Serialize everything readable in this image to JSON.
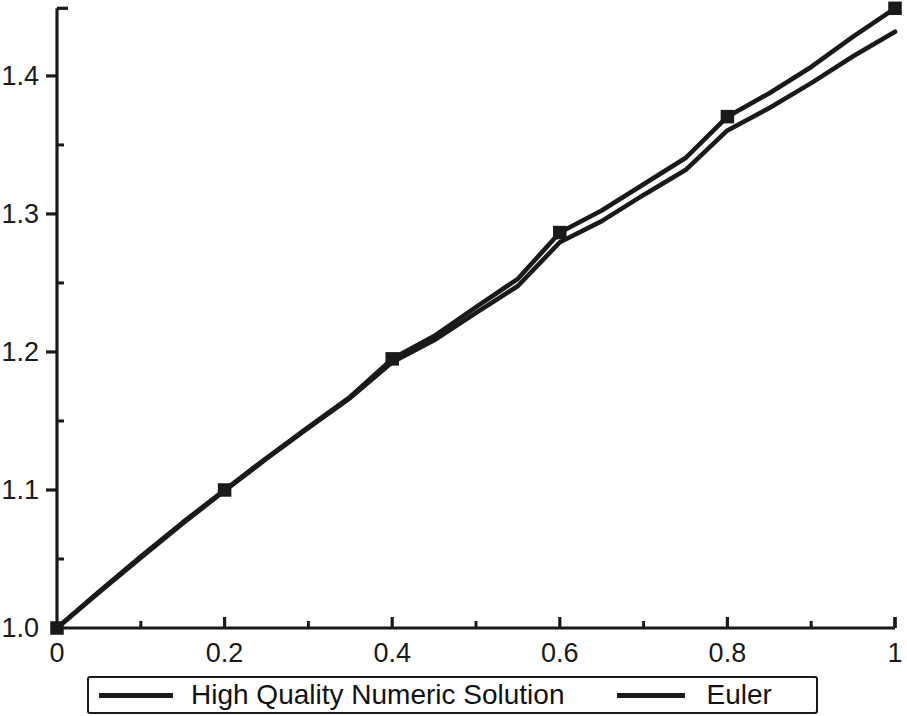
{
  "chart_data": {
    "type": "line",
    "title": "",
    "xlabel": "",
    "ylabel": "",
    "xlim": [
      0,
      1
    ],
    "ylim": [
      1.0,
      1.449
    ],
    "grid": false,
    "legend_position": "bottom",
    "x_ticks_major": [
      0,
      0.2,
      0.4,
      0.6,
      0.8,
      1
    ],
    "x_tick_labels": [
      "0",
      "0.2",
      "0.4",
      "0.6",
      "0.8",
      "1"
    ],
    "x_ticks_minor": [
      0.1,
      0.3,
      0.5,
      0.7,
      0.9
    ],
    "y_ticks_major": [
      1.0,
      1.1,
      1.2,
      1.3,
      1.4
    ],
    "y_tick_labels": [
      "1.0",
      "1.1",
      "1.2",
      "1.3",
      "1.4"
    ],
    "y_ticks_minor": [
      1.05,
      1.15,
      1.25,
      1.35,
      1.45
    ],
    "series": [
      {
        "name": "High Quality Numeric Solution",
        "color": "#1a1a1a",
        "marker": "square",
        "marker_x": [
          0,
          0.2,
          0.4,
          0.6,
          0.8,
          1.0
        ],
        "marker_y": [
          1.0,
          1.1,
          1.195,
          1.2865,
          1.3705,
          1.449
        ],
        "x": [
          0,
          0.05,
          0.1,
          0.15,
          0.2,
          0.25,
          0.3,
          0.35,
          0.4,
          0.45,
          0.5,
          0.55,
          0.6,
          0.65,
          0.7,
          0.75,
          0.8,
          0.85,
          0.9,
          0.95,
          1.0
        ],
        "y": [
          1.0,
          1.0262,
          1.0518,
          1.0765,
          1.1,
          1.1232,
          1.1456,
          1.1675,
          1.195,
          1.2115,
          1.2325,
          1.253,
          1.2865,
          1.3025,
          1.3215,
          1.3405,
          1.3705,
          1.3875,
          1.4065,
          1.4285,
          1.449
        ]
      },
      {
        "name": "Euler",
        "color": "#1a1a1a",
        "marker": "none",
        "x": [
          0,
          0.05,
          0.1,
          0.15,
          0.2,
          0.25,
          0.3,
          0.35,
          0.4,
          0.45,
          0.5,
          0.55,
          0.6,
          0.65,
          0.7,
          0.75,
          0.8,
          0.85,
          0.9,
          0.95,
          1.0
        ],
        "y": [
          1.0,
          1.0258,
          1.051,
          1.0757,
          1.0995,
          1.1226,
          1.1449,
          1.1668,
          1.1925,
          1.2085,
          1.2283,
          1.2478,
          1.2795,
          1.2948,
          1.3138,
          1.3318,
          1.3605,
          1.3768,
          1.3948,
          1.4143,
          1.432
        ]
      }
    ]
  },
  "axes": {
    "axis_color": "#1a1a1a",
    "tick_color": "#1a1a1a"
  },
  "legend": {
    "entries": [
      {
        "label": "High Quality Numeric Solution",
        "color": "#1a1a1a"
      },
      {
        "label": "Euler",
        "color": "#1a1a1a"
      }
    ]
  }
}
